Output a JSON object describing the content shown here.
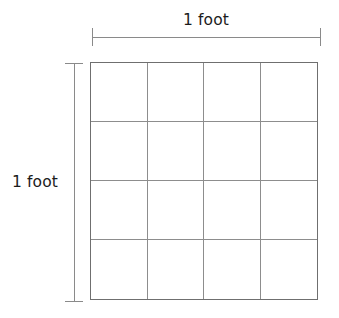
{
  "diagram": {
    "type": "square-foot-grid",
    "background_color": "#ffffff",
    "width_label": "1 foot",
    "height_label": "1 foot",
    "top_dimension": {
      "label": "1 foot",
      "orientation": "horizontal",
      "tick_count": 2
    },
    "left_dimension": {
      "label": "1 foot",
      "orientation": "vertical",
      "tick_count": 2
    },
    "grid": {
      "columns": 4,
      "rows": 4,
      "total_cells": 16,
      "line_color": "#8d8d8d",
      "border_color": "#6f6f6f",
      "cell_fill": "#ffffff",
      "cells": [
        [
          null,
          null,
          null,
          null
        ],
        [
          null,
          null,
          null,
          null
        ],
        [
          null,
          null,
          null,
          null
        ],
        [
          null,
          null,
          null,
          null
        ]
      ]
    }
  }
}
